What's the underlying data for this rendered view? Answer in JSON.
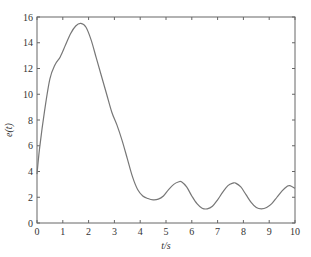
{
  "chart_data": {
    "type": "line",
    "title": "",
    "xlabel": "t/s",
    "ylabel": "e(t)",
    "xlim": [
      0,
      10
    ],
    "ylim": [
      0,
      16
    ],
    "xticks": [
      0,
      1,
      2,
      3,
      4,
      5,
      6,
      7,
      8,
      9,
      10
    ],
    "yticks": [
      0,
      2,
      4,
      6,
      8,
      10,
      12,
      14,
      16
    ],
    "grid": false,
    "legend": null,
    "series": [
      {
        "name": "e(t)",
        "color": "#777777",
        "x": [
          0,
          0.1,
          0.3,
          0.5,
          0.7,
          0.9,
          1.1,
          1.3,
          1.5,
          1.7,
          1.9,
          2.1,
          2.3,
          2.5,
          2.7,
          2.9,
          3.1,
          3.3,
          3.5,
          3.7,
          3.9,
          4.1,
          4.3,
          4.5,
          4.7,
          4.9,
          5.1,
          5.3,
          5.5,
          5.6,
          5.8,
          6.0,
          6.2,
          6.4,
          6.6,
          6.8,
          7.0,
          7.2,
          7.4,
          7.6,
          7.7,
          7.9,
          8.1,
          8.3,
          8.5,
          8.7,
          8.9,
          9.1,
          9.3,
          9.5,
          9.7,
          9.8,
          10.0
        ],
        "y": [
          3.8,
          5.8,
          8.8,
          11.2,
          12.3,
          12.9,
          13.8,
          14.7,
          15.3,
          15.5,
          15.2,
          14.2,
          12.8,
          11.4,
          10.0,
          8.6,
          7.6,
          6.4,
          5.0,
          3.6,
          2.6,
          2.1,
          1.9,
          1.8,
          1.85,
          2.1,
          2.6,
          3.0,
          3.2,
          3.2,
          2.8,
          2.1,
          1.5,
          1.15,
          1.1,
          1.3,
          1.8,
          2.4,
          2.9,
          3.1,
          3.1,
          2.8,
          2.2,
          1.6,
          1.2,
          1.1,
          1.2,
          1.5,
          2.0,
          2.5,
          2.85,
          2.9,
          2.7
        ]
      }
    ]
  }
}
